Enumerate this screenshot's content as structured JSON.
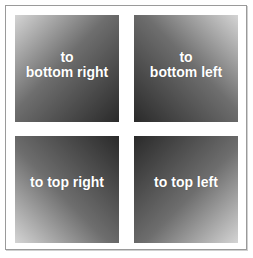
{
  "panels": [
    {
      "line1": "to",
      "line2": "bottom right",
      "gradient_direction": "to bottom right"
    },
    {
      "line1": "to",
      "line2": "bottom left",
      "gradient_direction": "to bottom left"
    },
    {
      "line1": "to top right",
      "line2": "",
      "gradient_direction": "to top right"
    },
    {
      "line1": "to top left",
      "line2": "",
      "gradient_direction": "to top left"
    }
  ],
  "colors": {
    "light": "#d4d4d4",
    "dark": "#2a2a2a",
    "border": "#9a9a9a",
    "text": "#ffffff"
  }
}
